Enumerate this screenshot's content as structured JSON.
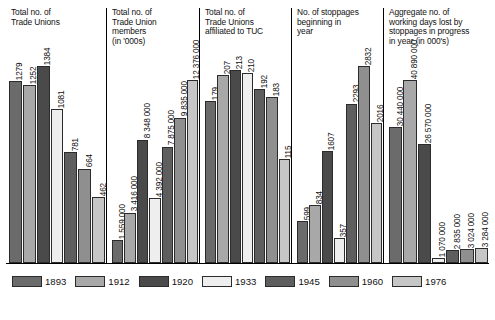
{
  "chart_data": {
    "type": "bar",
    "title": "",
    "xlabel": "",
    "ylabel": "",
    "grid": false,
    "legend_position": "bottom",
    "categories": [
      "1893",
      "1912",
      "1920",
      "1933",
      "1945",
      "1960",
      "1976"
    ],
    "series_colors": [
      "#6b6b6b",
      "#a8a8a8",
      "#4a4a4a",
      "#eeeeee",
      "#5e5e5e",
      "#8f8f8f",
      "#c6c6c6"
    ],
    "panels": [
      {
        "title": "Total no. of\nTrade Unions",
        "values": [
          1279,
          1252,
          1384,
          1081,
          781,
          664,
          462
        ],
        "labels": [
          "1279",
          "1252",
          "1384",
          "1081",
          "781",
          "664",
          "462"
        ],
        "ymax": 1384
      },
      {
        "title": "Total no. of\nTrade Union\nmembers\n(in '000s)",
        "values": [
          1559000,
          3416000,
          8348000,
          4392000,
          7875000,
          9835000,
          12376000
        ],
        "labels": [
          "1 559 000",
          "3 416 000",
          "8 348 000",
          "4 392 000",
          "7 875 000",
          "9 835 000",
          "12 376 000"
        ],
        "ymax": 12376000
      },
      {
        "title": "Total no. of\nTrade Unions\naffiliated to TUC",
        "values": [
          179,
          207,
          213,
          210,
          192,
          183,
          115
        ],
        "labels": [
          "179",
          "207",
          "213",
          "210",
          "192",
          "183",
          "115"
        ],
        "ymax": 213
      },
      {
        "title": "No. of stoppages\nbeginning in\nyear",
        "values": [
          599,
          834,
          1607,
          357,
          2293,
          2832,
          2016
        ],
        "labels": [
          "599",
          "834",
          "1607",
          "357",
          "2293",
          "2832",
          "2016"
        ],
        "ymax": 2832
      },
      {
        "title": "Aggregate no. of\nworking days lost by\nstoppages in progress\nin year (in 000's)",
        "values": [
          30440000,
          40890000,
          26570000,
          1070000,
          2835000,
          3024000,
          3284000
        ],
        "labels": [
          "30 440 000",
          "40 890 000",
          "26 570 000",
          "1 070 000",
          "2 835 000",
          "3 024 000",
          "3 284 000"
        ],
        "ymax": 40890000
      }
    ]
  }
}
